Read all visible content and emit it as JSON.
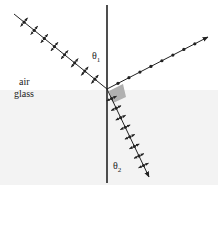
{
  "diagram": {
    "title": "",
    "media": {
      "upper": "air",
      "lower": "glass"
    },
    "angles": {
      "incident": {
        "symbol": "θ",
        "sub": "1"
      },
      "refracted": {
        "symbol": "θ",
        "sub": "2"
      }
    },
    "colors": {
      "background": "#ffffff",
      "glass": "#f3f3f3",
      "line": "#222222",
      "marker": "#b0b0b0"
    },
    "geometry": {
      "normal": {
        "x": 107,
        "y1": 5,
        "y2": 183
      },
      "interface_y": 90,
      "origin": {
        "x": 107,
        "y": 89
      },
      "incident_start": {
        "x": 14,
        "y": 14
      },
      "reflected_end": {
        "x": 208,
        "y": 37
      },
      "refracted_end": {
        "x": 149,
        "y": 177
      }
    },
    "rays": [
      {
        "name": "incident",
        "polarization": "in-plane",
        "markers": 8
      },
      {
        "name": "reflected",
        "polarization": "perpendicular",
        "markers": 8
      },
      {
        "name": "refracted",
        "polarization": "in-plane",
        "markers": 8
      }
    ]
  }
}
